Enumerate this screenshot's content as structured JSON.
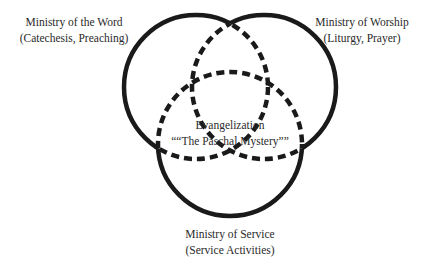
{
  "diagram": {
    "type": "venn-3",
    "stroke_color": "#1a1a1a",
    "circles": [
      {
        "id": "word",
        "cx": 196,
        "cy": 87,
        "r": 72
      },
      {
        "id": "worship",
        "cx": 264,
        "cy": 87,
        "r": 72
      },
      {
        "id": "service",
        "cx": 230,
        "cy": 144,
        "r": 72
      }
    ],
    "labels": {
      "word": {
        "title": "Ministry of the Word",
        "subtitle": "(Catechesis, Preaching)"
      },
      "worship": {
        "title": "Ministry of Worship",
        "subtitle": "(Liturgy, Prayer)"
      },
      "service": {
        "title": "Ministry of Service",
        "subtitle": "(Service Activities)"
      },
      "center": {
        "title": "Evangelization",
        "subtitle": "““The Paschal Mystery””"
      }
    }
  }
}
